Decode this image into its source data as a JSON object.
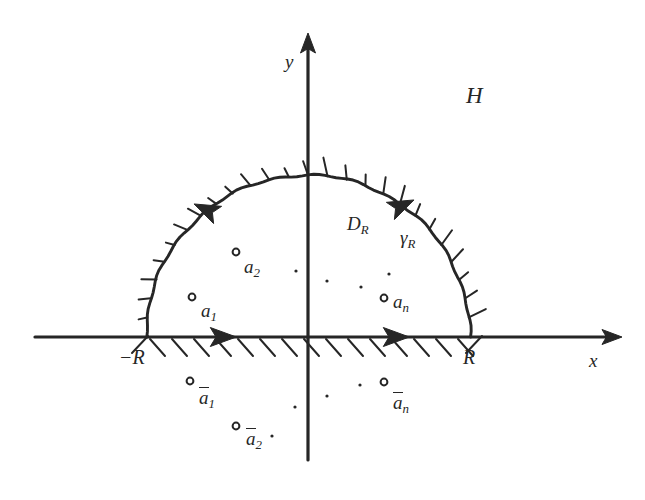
{
  "figure": {
    "background": "#ffffff",
    "ink": "#262626",
    "width": 645,
    "height": 500
  },
  "axes": {
    "x_label": "x",
    "y_label": "y",
    "origin": {
      "x": 308,
      "y": 337
    },
    "x_axis": {
      "x1": 35,
      "y1": 337,
      "x2": 615,
      "y2": 337,
      "arrow": "right"
    },
    "y_axis": {
      "x1": 308,
      "y1": 460,
      "x2": 308,
      "y2": 40,
      "arrow": "up"
    }
  },
  "labels": {
    "half_plane": "H",
    "domain": "D",
    "domain_sub": "R",
    "contour_arc": "γ",
    "contour_arc_sub": "R",
    "left_endpoint": "−R",
    "right_endpoint": "R"
  },
  "contour": {
    "radius": 162,
    "center_x": 308,
    "center_y": 337,
    "orientation": "counterclockwise",
    "hatching": "outward",
    "arrows": [
      {
        "name": "arc-arrow-left",
        "x": 207,
        "y": 210,
        "angle": 205
      },
      {
        "name": "arc-arrow-right",
        "x": 401,
        "y": 206,
        "angle": 335
      },
      {
        "name": "axis-arrow-left",
        "x": 222,
        "y": 337,
        "angle": 0
      },
      {
        "name": "axis-arrow-right",
        "x": 395,
        "y": 337,
        "angle": 0
      }
    ]
  },
  "poles_upper": [
    {
      "id": "a1",
      "label": "a",
      "sub": "1",
      "cx": 192,
      "cy": 297,
      "lx": 201,
      "ly": 301
    },
    {
      "id": "a2",
      "label": "a",
      "sub": "2",
      "cx": 236,
      "cy": 252,
      "lx": 244,
      "ly": 257
    },
    {
      "id": "an",
      "label": "a",
      "sub": "n",
      "cx": 384,
      "cy": 298,
      "lx": 393,
      "ly": 292
    }
  ],
  "poles_lower": [
    {
      "id": "a1bar",
      "label": "a",
      "sub": "1",
      "cx": 190,
      "cy": 381,
      "lx": 199,
      "ly": 388
    },
    {
      "id": "a2bar",
      "label": "a",
      "sub": "2",
      "cx": 236,
      "cy": 426,
      "lx": 246,
      "ly": 429
    },
    {
      "id": "anbar",
      "label": "a",
      "sub": "n",
      "cx": 384,
      "cy": 382,
      "lx": 393,
      "ly": 393
    }
  ],
  "ellipsis_upper": [
    {
      "x": 296,
      "y": 271
    },
    {
      "x": 327,
      "y": 281
    },
    {
      "x": 361,
      "y": 287
    },
    {
      "x": 389,
      "y": 274
    }
  ],
  "ellipsis_lower": [
    {
      "x": 295,
      "y": 407
    },
    {
      "x": 327,
      "y": 396
    },
    {
      "x": 360,
      "y": 385
    },
    {
      "x": 272,
      "y": 436
    }
  ],
  "label_positions": {
    "H": {
      "x": 466,
      "y": 84
    },
    "y": {
      "x": 285,
      "y": 52
    },
    "x": {
      "x": 589,
      "y": 351
    },
    "D_R": {
      "x": 347,
      "y": 214
    },
    "gamma_R": {
      "x": 400,
      "y": 228
    },
    "minusR": {
      "x": 119,
      "y": 347
    },
    "R": {
      "x": 463,
      "y": 347
    }
  }
}
